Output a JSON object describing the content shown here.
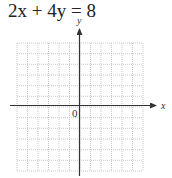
{
  "equation": {
    "text": "2x + 4y = 8"
  },
  "graph": {
    "x_label": "x",
    "y_label": "y",
    "origin_label": "0",
    "grid_columns": 12,
    "grid_rows": 12,
    "grid_color": "#c8c8c8",
    "axis_color": "#333333"
  }
}
